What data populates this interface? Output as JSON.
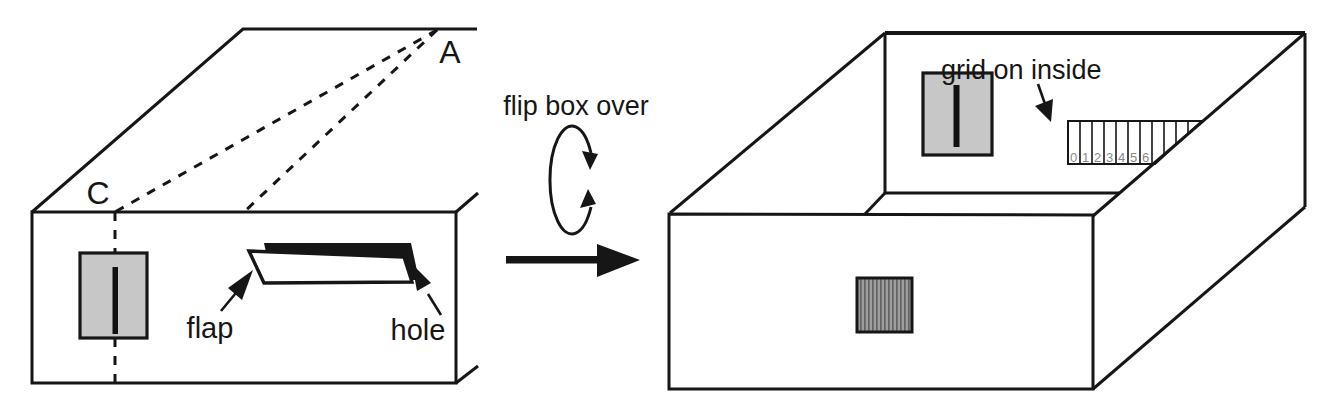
{
  "colors": {
    "background": "#ffffff",
    "ink": "#161616",
    "panel_fill": "#c7c7c7",
    "slit": "#111111",
    "stripe_fill": "#9d9d9d",
    "stripe_line": "#646464",
    "grid_number": "#8a8a8a"
  },
  "left_box": {
    "label_a": "A",
    "label_c": "C",
    "flap_label": "flap",
    "hole_label": "hole"
  },
  "transition": {
    "caption": "flip box over"
  },
  "right_box": {
    "grid_label": "grid on inside",
    "grid_numbers": [
      "0",
      "1",
      "2",
      "3",
      "4",
      "5",
      "6"
    ]
  }
}
